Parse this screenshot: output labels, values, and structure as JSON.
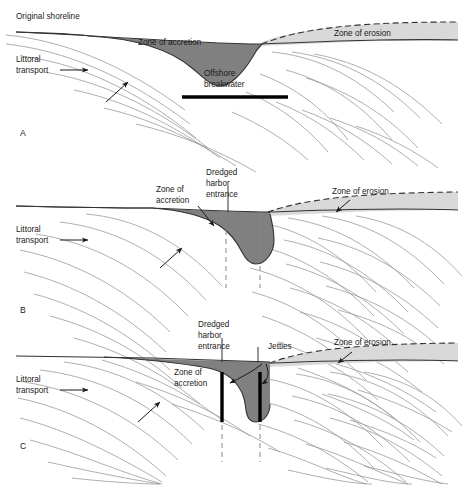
{
  "figure": {
    "type": "three-panel cross-shore plan-view diagram",
    "colors": {
      "accretion_fill": "#808080",
      "erosion_fill": "#d9d9d9",
      "shoreline_stroke": "#333333",
      "wave_line": "#9a9a9a",
      "structure_black": "#000000",
      "background": "#ffffff",
      "text": "#1a1a1a"
    },
    "panels": [
      {
        "letter": "A",
        "name": "offshore-breakwater",
        "labels": {
          "original_shoreline": "Original shoreline",
          "littoral_transport_line1": "Littoral",
          "littoral_transport_line2": "transport",
          "zone_of_accretion": "Zone of accretion",
          "zone_of_erosion": "Zone of erosion",
          "structure_line1": "Offshore",
          "structure_line2": "breakwater"
        }
      },
      {
        "letter": "B",
        "name": "dredged-harbor-entrance",
        "labels": {
          "littoral_transport_line1": "Littoral",
          "littoral_transport_line2": "transport",
          "zone_of_accretion_line1": "Zone of",
          "zone_of_accretion_line2": "accretion",
          "zone_of_erosion": "Zone of erosion",
          "structure_line1": "Dredged",
          "structure_line2": "harbor",
          "structure_line3": "entrance"
        }
      },
      {
        "letter": "C",
        "name": "jettied-harbor-entrance",
        "labels": {
          "littoral_transport_line1": "Littoral",
          "littoral_transport_line2": "transport",
          "zone_of_accretion_line1": "Zone of",
          "zone_of_accretion_line2": "accretion",
          "zone_of_erosion": "Zone of erosion",
          "structure_line1": "Dredged",
          "structure_line2": "harbor",
          "structure_line3": "entrance",
          "jetties": "Jetties"
        }
      }
    ]
  }
}
